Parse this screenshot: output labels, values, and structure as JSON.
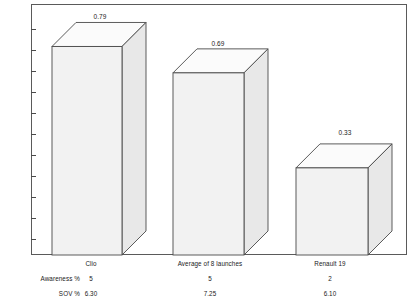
{
  "chart_data": {
    "type": "bar",
    "title": "",
    "subtitle": "",
    "xlabel": "",
    "ylabel": "",
    "grid": false,
    "legend": false,
    "style": "3d-column",
    "categories": [
      "Clio",
      "Average of 8 launches",
      "Renault 19"
    ],
    "values": [
      0.79,
      0.69,
      0.33
    ],
    "value_labels": [
      "0.79",
      "0.69",
      "0.33"
    ],
    "ylim": [
      0,
      0.86
    ],
    "y_ticks_unlabeled": 11,
    "annotations_table": {
      "rows": [
        {
          "label": "Awareness %",
          "values": [
            "5",
            "5",
            "2"
          ]
        },
        {
          "label": "SOV %",
          "values": [
            "6.30",
            "7.25",
            "6.10"
          ]
        }
      ]
    }
  },
  "colors": {
    "bar_front": "#f2f2f2",
    "bar_top": "#fbfbfb",
    "bar_side": "#e8e8e8",
    "bar_outline": "#4a4a4a",
    "frame": "#5a5a5a",
    "text": "#1a1a1a"
  }
}
